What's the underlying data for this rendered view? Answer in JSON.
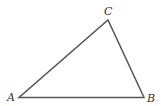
{
  "diagram": {
    "type": "triangle",
    "stroke_color": "#555555",
    "label_color": "#333333",
    "vertices": [
      {
        "label": "A",
        "x": 19,
        "y": 97.5,
        "label_x": 7,
        "label_y": 101
      },
      {
        "label": "B",
        "x": 144,
        "y": 97.5,
        "label_x": 147,
        "label_y": 102
      },
      {
        "label": "C",
        "x": 108,
        "y": 20,
        "label_x": 104,
        "label_y": 15
      }
    ]
  }
}
